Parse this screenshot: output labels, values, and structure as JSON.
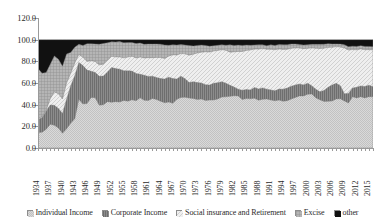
{
  "chart_data": {
    "type": "area",
    "stacked": "100-percent",
    "title": "",
    "subtitle": "",
    "xlabel": "",
    "ylabel": "",
    "ylim": [
      0,
      120
    ],
    "yticks": [
      "0.0",
      "20.0",
      "40.0",
      "60.0",
      "80.0",
      "100.0",
      "120.0"
    ],
    "ytick_values": [
      0,
      20,
      40,
      60,
      80,
      100,
      120
    ],
    "grid": true,
    "legend_position": "bottom",
    "xtick_labels": [
      "1934",
      "1937",
      "1940",
      "1943",
      "1946",
      "1949",
      "1952",
      "1955",
      "1958",
      "1961",
      "1964",
      "1967",
      "1970",
      "1973",
      "1976",
      "1979",
      "1982",
      "1985",
      "1988",
      "1991",
      "1994",
      "1997",
      "2000",
      "2003",
      "2006",
      "2009",
      "2012",
      "2015"
    ],
    "x": [
      1934,
      1935,
      1936,
      1937,
      1938,
      1939,
      1940,
      1941,
      1942,
      1943,
      1944,
      1945,
      1946,
      1947,
      1948,
      1949,
      1950,
      1951,
      1952,
      1953,
      1954,
      1955,
      1956,
      1957,
      1958,
      1959,
      1960,
      1961,
      1962,
      1963,
      1964,
      1965,
      1966,
      1967,
      1968,
      1969,
      1970,
      1971,
      1972,
      1973,
      1974,
      1975,
      1976,
      1977,
      1978,
      1979,
      1980,
      1981,
      1982,
      1983,
      1984,
      1985,
      1986,
      1987,
      1988,
      1989,
      1990,
      1991,
      1992,
      1993,
      1994,
      1995,
      1996,
      1997,
      1998,
      1999,
      2000,
      2001,
      2002,
      2003,
      2004,
      2005,
      2006,
      2007,
      2008,
      2009,
      2010,
      2011,
      2012,
      2013,
      2014,
      2015,
      2016
    ],
    "series": [
      {
        "name": "Individual Income",
        "pattern": "light-checker",
        "color": "#cfcfcf",
        "values": [
          14.2,
          14.6,
          17.2,
          21.9,
          21.0,
          18.4,
          13.6,
          17.7,
          22.9,
          27.1,
          45.0,
          40.7,
          41.0,
          46.6,
          46.5,
          39.5,
          39.9,
          42.8,
          42.2,
          42.8,
          42.4,
          43.9,
          43.2,
          44.5,
          43.6,
          46.3,
          44.0,
          43.8,
          45.7,
          44.7,
          43.2,
          41.8,
          42.4,
          41.3,
          44.9,
          46.7,
          46.9,
          46.1,
          45.7,
          44.7,
          45.2,
          43.9,
          44.2,
          44.3,
          45.3,
          47.0,
          47.2,
          47.7,
          48.2,
          48.1,
          44.8,
          45.6,
          45.4,
          46.0,
          44.1,
          45.0,
          45.2,
          44.3,
          43.6,
          44.2,
          43.1,
          43.7,
          45.2,
          46.7,
          48.1,
          48.1,
          49.6,
          49.9,
          46.3,
          44.5,
          43.0,
          43.1,
          43.4,
          45.3,
          45.4,
          43.5,
          41.5,
          47.4,
          46.2,
          47.4,
          46.2,
          47.4,
          47.3
        ]
      },
      {
        "name": "Corporate Income",
        "pattern": "dark-vertical",
        "color": "#808080",
        "values": [
          12.3,
          13.3,
          16.8,
          17.8,
          18.4,
          18.1,
          18.3,
          27.4,
          34.3,
          39.7,
          33.9,
          35.4,
          30.9,
          24.3,
          23.3,
          26.7,
          26.5,
          27.3,
          32.1,
          30.5,
          30.3,
          27.3,
          28.0,
          26.5,
          25.2,
          21.8,
          23.2,
          22.2,
          20.6,
          20.3,
          20.9,
          21.8,
          23.0,
          22.8,
          18.7,
          19.6,
          17.0,
          14.3,
          15.5,
          15.7,
          14.7,
          14.6,
          13.9,
          15.4,
          15.0,
          14.2,
          12.5,
          10.2,
          8.0,
          6.2,
          8.5,
          8.4,
          8.2,
          9.8,
          10.4,
          10.5,
          9.1,
          9.3,
          9.2,
          10.2,
          11.2,
          11.6,
          11.8,
          11.5,
          11.0,
          10.1,
          10.2,
          7.6,
          8.0,
          7.4,
          10.1,
          12.9,
          14.7,
          14.4,
          12.1,
          6.6,
          8.9,
          7.9,
          9.9,
          9.9,
          10.6,
          10.6,
          9.2
        ]
      },
      {
        "name": "Social insurance and Retirement",
        "pattern": "light-diagonal",
        "color": "#e8e8e8",
        "values": [
          1.0,
          0.8,
          0.9,
          5.8,
          12.4,
          13.5,
          13.4,
          14.9,
          11.8,
          11.7,
          7.4,
          7.6,
          8.0,
          9.6,
          10.0,
          10.5,
          11.0,
          10.9,
          10.3,
          10.7,
          11.3,
          12.0,
          12.7,
          13.8,
          14.3,
          15.8,
          15.9,
          17.4,
          17.1,
          18.6,
          19.5,
          19.0,
          19.4,
          22.0,
          22.2,
          20.9,
          23.0,
          25.3,
          25.4,
          27.3,
          28.5,
          30.3,
          30.5,
          29.8,
          29.8,
          29.6,
          30.5,
          30.5,
          32.6,
          34.8,
          35.8,
          36.1,
          36.9,
          35.5,
          36.8,
          36.3,
          36.8,
          37.5,
          37.9,
          37.0,
          36.7,
          35.8,
          35.1,
          34.2,
          33.2,
          33.5,
          32.2,
          34.9,
          37.8,
          40.0,
          39.0,
          36.9,
          34.8,
          33.9,
          35.7,
          42.3,
          40.0,
          35.6,
          34.5,
          34.2,
          33.9,
          32.8,
          34.1
        ]
      },
      {
        "name": "Excise",
        "pattern": "medium-grid",
        "color": "#a8a8a8",
        "values": [
          45.8,
          40.4,
          34.7,
          31.7,
          33.2,
          31.9,
          30.2,
          26.8,
          19.2,
          14.5,
          9.5,
          11.0,
          16.3,
          15.7,
          16.2,
          19.1,
          19.1,
          16.1,
          13.4,
          13.8,
          14.2,
          14.0,
          13.4,
          12.6,
          13.3,
          13.0,
          12.6,
          12.6,
          12.5,
          12.4,
          12.2,
          12.5,
          10.0,
          9.2,
          9.2,
          8.3,
          8.1,
          8.9,
          7.5,
          7.0,
          6.6,
          5.9,
          5.4,
          4.9,
          4.7,
          4.5,
          4.7,
          6.8,
          5.9,
          5.9,
          5.6,
          4.9,
          4.3,
          3.8,
          3.9,
          3.4,
          3.4,
          4.1,
          4.0,
          4.2,
          4.4,
          4.3,
          3.9,
          3.6,
          3.3,
          3.4,
          3.4,
          3.3,
          3.6,
          3.8,
          3.7,
          3.4,
          3.1,
          2.5,
          2.7,
          3.0,
          3.1,
          3.1,
          3.2,
          3.0,
          3.1,
          3.0,
          2.9
        ]
      },
      {
        "name": "other",
        "pattern": "solid-black",
        "color": "#111111",
        "values": [
          26.7,
          30.9,
          30.4,
          22.8,
          15.0,
          18.1,
          24.5,
          13.2,
          11.8,
          7.0,
          4.2,
          5.3,
          3.8,
          3.8,
          4.0,
          4.2,
          3.5,
          2.9,
          2.0,
          2.2,
          1.8,
          2.8,
          2.7,
          2.6,
          3.6,
          3.1,
          4.3,
          4.0,
          4.1,
          4.0,
          4.2,
          4.9,
          5.2,
          4.7,
          5.0,
          4.5,
          5.0,
          5.4,
          5.9,
          5.3,
          5.0,
          5.3,
          6.0,
          5.6,
          5.2,
          4.7,
          5.1,
          4.8,
          5.3,
          5.0,
          5.3,
          5.0,
          5.2,
          4.9,
          4.8,
          4.8,
          5.5,
          4.8,
          5.3,
          4.4,
          4.6,
          4.6,
          4.0,
          4.0,
          4.4,
          4.9,
          4.6,
          4.3,
          4.3,
          4.3,
          4.2,
          3.7,
          4.0,
          3.9,
          4.1,
          4.6,
          6.5,
          6.0,
          6.2,
          5.5,
          6.2,
          6.2,
          6.5
        ]
      }
    ]
  },
  "legend": {
    "items": [
      {
        "label": "Individual Income",
        "swatch": "light-checker"
      },
      {
        "label": "Corporate Income",
        "swatch": "dark-vertical"
      },
      {
        "label": "Social insurance and Retirement",
        "swatch": "light-diagonal"
      },
      {
        "label": "Excise",
        "swatch": "medium-grid"
      },
      {
        "label": "other",
        "swatch": "solid-black"
      }
    ]
  }
}
